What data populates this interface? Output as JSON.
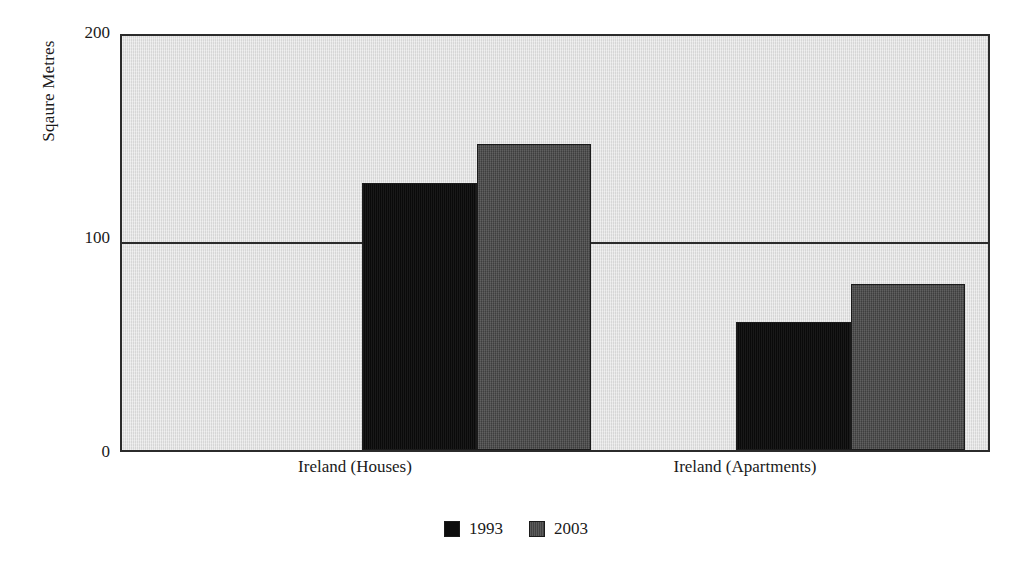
{
  "chart_data": {
    "type": "bar",
    "title": "",
    "subtitle": "",
    "xlabel": "",
    "ylabel": "Sqaure Metres",
    "categories": [
      "Ireland (Houses)",
      "Ireland (Apartments)"
    ],
    "series": [
      {
        "name": "1993",
        "color": "#0d0d0d",
        "values": [
          129,
          62
        ]
      },
      {
        "name": "2003",
        "color": "#4a4a4a",
        "values": [
          148,
          80
        ]
      }
    ],
    "ylim": [
      0,
      200
    ],
    "yticks": [
      0,
      100,
      200
    ],
    "ytick_labels": [
      "0",
      "100",
      "200"
    ],
    "gridlines": [
      100
    ],
    "grid": true,
    "legend_position": "bottom",
    "plot_background": "#e2e2e2",
    "axis_color": "#2b2b2b",
    "annotations": []
  },
  "axis": {
    "y_title": "Sqaure Metres",
    "y_tick_200": "200",
    "y_tick_100": "100",
    "y_tick_0": "0"
  },
  "categories": {
    "cat_0": "Ireland (Houses)",
    "cat_1": "Ireland (Apartments)"
  },
  "legend": {
    "items": [
      {
        "label": "1993"
      },
      {
        "label": "2003"
      }
    ]
  }
}
